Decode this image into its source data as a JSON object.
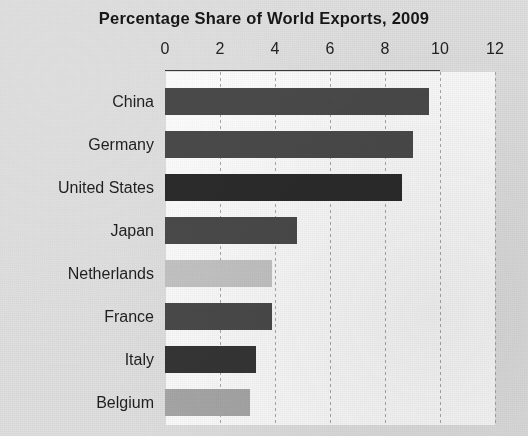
{
  "chart_data": {
    "type": "bar",
    "orientation": "horizontal",
    "title": "Percentage Share of World Exports, 2009",
    "xlabel": "",
    "ylabel": "",
    "xlim": [
      0,
      12
    ],
    "xticks": [
      0,
      2,
      4,
      6,
      8,
      10,
      12
    ],
    "xtick_labels": [
      "0",
      "2",
      "4",
      "6",
      "8",
      "10",
      "12"
    ],
    "grid": true,
    "grid_axis": "x",
    "legend": false,
    "categories": [
      "China",
      "Germany",
      "United States",
      "Japan",
      "Netherlands",
      "France",
      "Italy",
      "Belgium"
    ],
    "values": [
      9.6,
      9.0,
      8.6,
      4.8,
      3.9,
      3.9,
      3.3,
      3.1
    ],
    "bar_colors": [
      "#4a4a4a",
      "#4a4a4a",
      "#2b2b2b",
      "#4a4a4a",
      "#c4c4c4",
      "#4a4a4a",
      "#353535",
      "#a7a7a7"
    ],
    "plot_background": "#fbfbfb",
    "page_background": "#dfdfdf"
  },
  "colors": {
    "text": "#1d1d1d",
    "gridline": "#9b9b9b",
    "axis_rule": "#3a3a3a"
  }
}
